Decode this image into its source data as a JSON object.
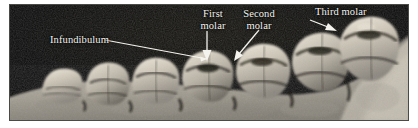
{
  "figure": {
    "type": "anatomical-photograph",
    "rendering": "black-and-white halftone photograph",
    "background_color": "#0a0a09",
    "bone_color": "#b9b3a6",
    "enamel_color": "#e4ded2",
    "label_color": "#f4f3ef",
    "frame_border_color": "#4a4a46",
    "page_background": "#ffffff"
  },
  "labels": [
    {
      "id": "infundibulum",
      "text": "Infundibulum",
      "lines": [
        "Infundibulum"
      ],
      "leader": "line-to-arrowhead",
      "points_to": "enamel infolding on molar crown"
    },
    {
      "id": "first-molar",
      "text": "First molar",
      "lines": [
        "First",
        "molar"
      ],
      "leader": "arrow-down",
      "points_to": "first molar crown"
    },
    {
      "id": "second-molar",
      "text": "Second molar",
      "lines": [
        "Second",
        "molar"
      ],
      "leader": "arrow-down-left",
      "points_to": "second molar crown"
    },
    {
      "id": "third-molar",
      "text": "Third molar",
      "lines": [
        "Third molar"
      ],
      "leader": "arrow-down-right",
      "points_to": "third molar crown"
    }
  ],
  "label_text": {
    "infundibulum": "Infundibulum",
    "first_molar_line1": "First",
    "first_molar_line2": "molar",
    "second_molar_line1": "Second",
    "second_molar_line2": "molar",
    "third_molar": "Third molar"
  },
  "teeth": {
    "count_visible": 7,
    "description": "row of high-crowned cheek teeth increasing in height toward the rear (right)"
  }
}
